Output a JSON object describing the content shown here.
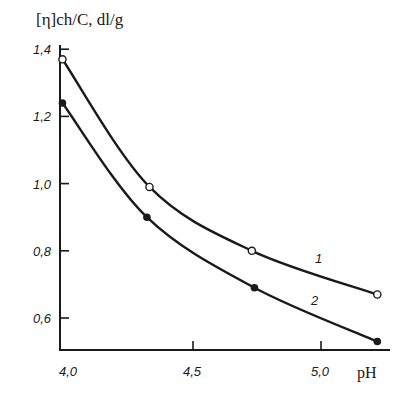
{
  "chart_data": {
    "type": "line",
    "title": "",
    "xlabel": "pH",
    "ylabel": "[η]ch/C, dl/g",
    "xlim": [
      4.0,
      5.25
    ],
    "ylim": [
      0.53,
      1.4
    ],
    "x_ticks": [
      "4,0",
      "4,5",
      "5,0"
    ],
    "x_tick_values": [
      4.0,
      4.5,
      5.0
    ],
    "y_ticks": [
      "1,4",
      "1,2",
      "1,0",
      "0,8",
      "0,6"
    ],
    "y_tick_values": [
      1.4,
      1.2,
      1.0,
      0.8,
      0.6
    ],
    "grid": false,
    "series": [
      {
        "name": "1",
        "marker": "open-circle",
        "x": [
          3.99,
          4.33,
          4.73,
          5.22
        ],
        "values": [
          1.37,
          0.99,
          0.8,
          0.67
        ]
      },
      {
        "name": "2",
        "marker": "filled-circle",
        "x": [
          3.99,
          4.32,
          4.74,
          5.22
        ],
        "values": [
          1.24,
          0.9,
          0.69,
          0.53
        ]
      }
    ],
    "line_color": "#1a1a1a"
  }
}
